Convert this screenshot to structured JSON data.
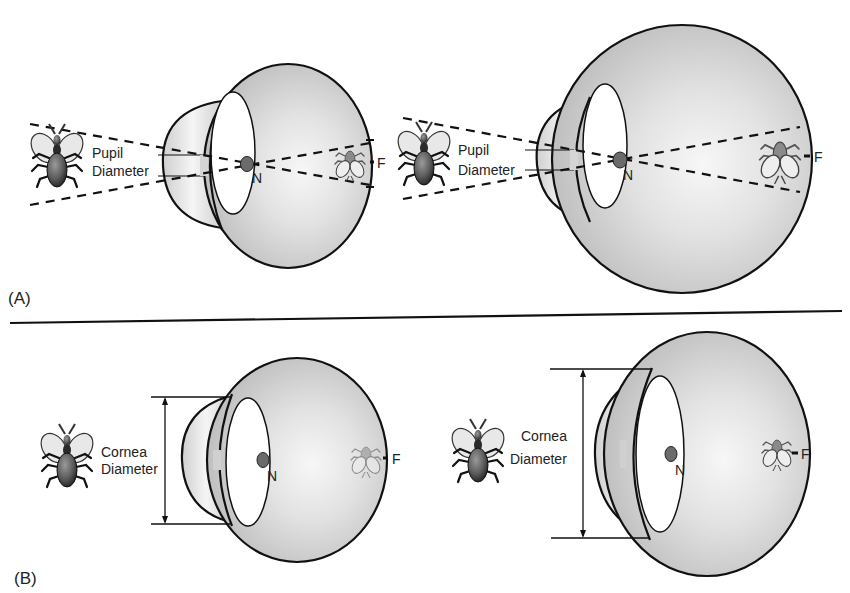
{
  "figure": {
    "panels": [
      {
        "id": "A",
        "label": "(A)",
        "eyes": [
          {
            "size": "small",
            "annotation_line1": "Pupil",
            "annotation_line2": "Diameter",
            "nodal_point": "N",
            "focal_point": "F"
          },
          {
            "size": "large",
            "annotation_line1": "Pupil",
            "annotation_line2": "Diameter",
            "nodal_point": "N",
            "focal_point": "F"
          }
        ]
      },
      {
        "id": "B",
        "label": "(B)",
        "eyes": [
          {
            "size": "small",
            "annotation_line1": "Cornea",
            "annotation_line2": "Diameter",
            "nodal_point": "N",
            "focal_point": "F"
          },
          {
            "size": "large",
            "annotation_line1": "Cornea",
            "annotation_line2": "Diameter",
            "nodal_point": "N",
            "focal_point": "F"
          }
        ]
      }
    ],
    "colors": {
      "eye_fill": "#c9c9c9",
      "eye_highlight": "#f4f4f4",
      "outline": "#111111",
      "nodal_dot": "#6b6b6b",
      "bug_body": "#555555",
      "bug_wing": "#e6e6e6"
    }
  }
}
